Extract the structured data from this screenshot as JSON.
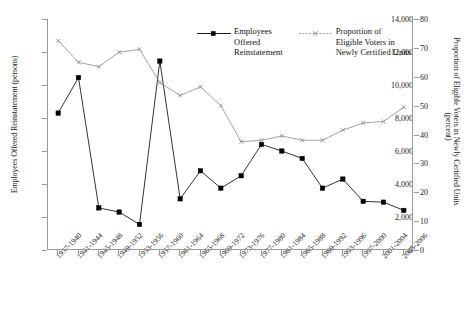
{
  "chart_data": {
    "type": "line",
    "title": "",
    "categories": [
      "1937-1940",
      "1941-1944",
      "1945-1948",
      "1949-1952",
      "1953-1956",
      "1957-1960",
      "1961-1964",
      "1965-1968",
      "1969-1972",
      "1973-1976",
      "1977-1980",
      "1981-1984",
      "1985-1988",
      "1989-1992",
      "1993-1996",
      "1997-2000",
      "2001-2004",
      "2005-2006"
    ],
    "series": [
      {
        "name": "Employees Offered Reinstatement",
        "axis": "left",
        "marker": "filled-square",
        "color": "#000000",
        "values": [
          8300,
          10450,
          2550,
          2300,
          1550,
          11450,
          3100,
          4800,
          3750,
          4500,
          6400,
          6000,
          5550,
          3750,
          4300,
          2950,
          2900,
          2400
        ]
      },
      {
        "name": "Proportion of Eligible Voters in Newly Certified Units",
        "axis": "right",
        "marker": "x-cross",
        "color": "#7a7a7a",
        "values": [
          72.5,
          65.0,
          63.5,
          68.5,
          69.5,
          58.0,
          53.5,
          56.5,
          50.0,
          37.5,
          38.0,
          39.5,
          38.0,
          38.0,
          41.5,
          44.0,
          44.5,
          49.5
        ]
      }
    ],
    "xlabel": "",
    "ylabel": "Employees Offered Reinstatement (persons)",
    "y2label": "Proportion of Eligible Voters in Newly Certified Units (percent)",
    "ylim": [
      0,
      14000
    ],
    "y2lim": [
      0,
      80
    ],
    "yticks": [
      "0",
      "2,000",
      "4,000",
      "6,000",
      "8,000",
      "10,000",
      "12,000",
      "14,000"
    ],
    "y2ticks": [
      "0",
      "10",
      "20",
      "30",
      "40",
      "50",
      "60",
      "70",
      "80"
    ],
    "grid": false,
    "legend_position": "top-center"
  },
  "axes": {
    "left_title": "Employees Offered Reinstatement (persons)",
    "right_title": "Proportion of Eligible Voters in Newly Certified Units",
    "right_unit": "(percent)"
  },
  "legend": {
    "entries": [
      {
        "label": "Employees\nOffered\nReinstatement",
        "marker": "filled-square",
        "color": "#000000"
      },
      {
        "label": "Proportion of\nEligible Voters in\nNewly Certified Units",
        "marker": "x-cross",
        "color": "#7a7a7a"
      }
    ]
  }
}
